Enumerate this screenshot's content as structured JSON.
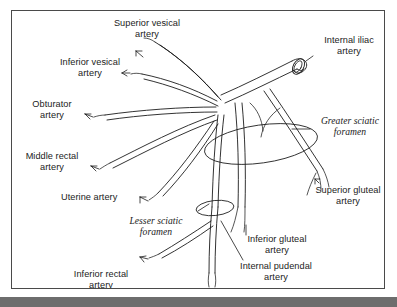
{
  "figure": {
    "kind": "anatomical-line-diagram",
    "style": "black-and-white line drawing with leader-line callouts",
    "frame_border_color": "#4a4a4a",
    "background_color": "#ffffff",
    "line_color": "#1c1c1c",
    "bottom_band_color": "#6d6d6d"
  },
  "labels": {
    "superior_vesical": "Superior vesical\nartery",
    "inferior_vesical": "Inferior vesical\nartery",
    "obturator": "Obturator\nartery",
    "middle_rectal": "Middle rectal\nartery",
    "uterine": "Uterine artery",
    "inferior_rectal": "Inferior rectal\nartery",
    "internal_iliac": "Internal iliac\nartery",
    "greater_sciatic_foramen": "Greater sciatic\nforamen",
    "lesser_sciatic_foramen": "Lesser sciatic\nforamen",
    "superior_gluteal": "Superior gluteal\nartery",
    "inferior_gluteal": "Inferior gluteal\nartery",
    "internal_pudendal": "Internal pudendal\nartery"
  },
  "structures": [
    {
      "name": "internal-iliac-artery",
      "role": "parent-trunk",
      "italic": false
    },
    {
      "name": "superior-vesical-artery",
      "role": "branch",
      "italic": false
    },
    {
      "name": "inferior-vesical-artery",
      "role": "branch",
      "italic": false
    },
    {
      "name": "obturator-artery",
      "role": "branch",
      "italic": false
    },
    {
      "name": "middle-rectal-artery",
      "role": "branch",
      "italic": false
    },
    {
      "name": "uterine-artery",
      "role": "branch",
      "italic": false
    },
    {
      "name": "inferior-rectal-artery",
      "role": "branch",
      "italic": false
    },
    {
      "name": "superior-gluteal-artery",
      "role": "branch",
      "italic": false
    },
    {
      "name": "inferior-gluteal-artery",
      "role": "branch",
      "italic": false
    },
    {
      "name": "internal-pudendal-artery",
      "role": "branch",
      "italic": false
    },
    {
      "name": "greater-sciatic-foramen",
      "role": "bony-aperture",
      "italic": true
    },
    {
      "name": "lesser-sciatic-foramen",
      "role": "bony-aperture",
      "italic": true
    }
  ]
}
